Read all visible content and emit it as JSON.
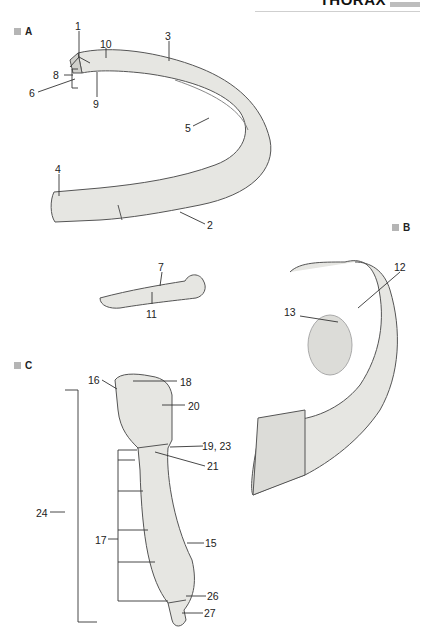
{
  "header": {
    "title": "THORAX"
  },
  "panels": {
    "A": {
      "label": "A"
    },
    "B": {
      "label": "B"
    },
    "C": {
      "label": "C"
    }
  },
  "labels": {
    "l1": "1",
    "l2": "2",
    "l3": "3",
    "l4": "4",
    "l5": "5",
    "l6": "6",
    "l7": "7",
    "l8": "8",
    "l9": "9",
    "l10": "10",
    "l11": "11",
    "l12": "12",
    "l13": "13",
    "l15": "15",
    "l16": "16",
    "l17": "17",
    "l18": "18",
    "l19_23": "19, 23",
    "l20": "20",
    "l21": "21",
    "l24": "24",
    "l26": "26",
    "l27": "27"
  },
  "colors": {
    "bone_fill": "#e6e6e2",
    "bone_shade": "#c9c9c4",
    "line": "#333333",
    "label_square": "#b5b5b5"
  }
}
